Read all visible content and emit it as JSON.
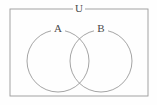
{
  "figure": {
    "kind": "venn-diagram",
    "background_color": "#fefefe",
    "stroke_color": "#9a9a9a",
    "label_color": "#4a4a4a",
    "stroke_width": 0.9
  },
  "universal_set": {
    "label": "U",
    "shape": "rectangle",
    "x": 10,
    "y": 9,
    "width": 138,
    "height": 87,
    "label_x": 79,
    "label_y": 9,
    "label_gap_half_width": 6
  },
  "sets": [
    {
      "label": "A",
      "shape": "circle",
      "cx": 58,
      "cy": 61,
      "r": 31,
      "label_x": 58,
      "label_y": 29,
      "label_gap_half_width": 7
    },
    {
      "label": "B",
      "shape": "circle",
      "cx": 101,
      "cy": 61,
      "r": 31,
      "label_x": 101,
      "label_y": 29,
      "label_gap_half_width": 7
    }
  ]
}
